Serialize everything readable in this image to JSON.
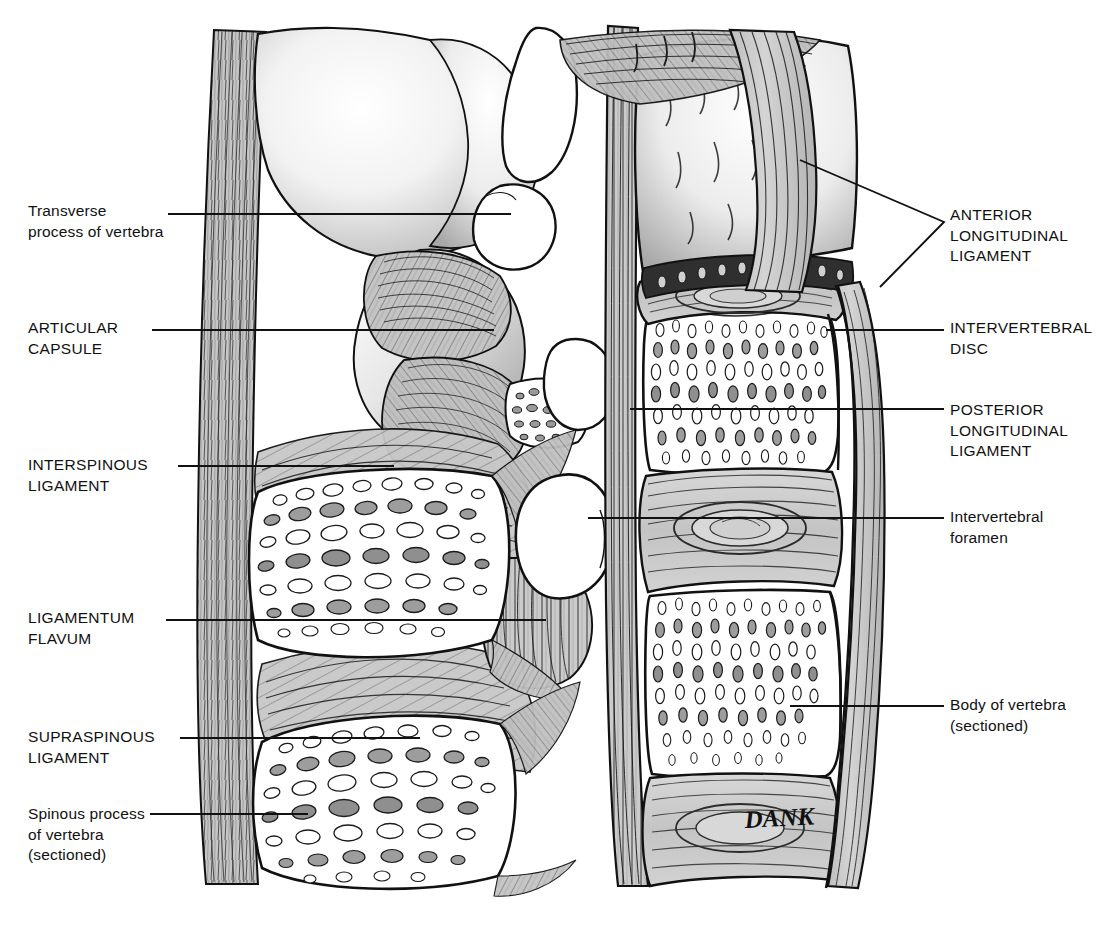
{
  "figure": {
    "signature": "DANK",
    "palette": {
      "ink": "#111111",
      "bone_fill": "#ffffff",
      "bone_shadow": "#d9d9d9",
      "ligament_fill": "#c9c9c9",
      "disc_fill": "#cfcfcf",
      "trabecula_dark": "#8f8f8f",
      "background": "#ffffff"
    }
  },
  "labels_left": [
    {
      "id": "transverse-process",
      "text": "Transverse\nprocess of vertebra",
      "style": "sentence",
      "x": 28,
      "y": 201,
      "leader": {
        "x1": 168,
        "y1": 214,
        "x2": 511,
        "y2": 214
      }
    },
    {
      "id": "articular-capsule",
      "text": "ARTICULAR\nCAPSULE",
      "style": "caps",
      "x": 28,
      "y": 318,
      "leader": {
        "x1": 152,
        "y1": 330,
        "x2": 494,
        "y2": 330
      }
    },
    {
      "id": "interspinous-ligament",
      "text": "INTERSPINOUS\nLIGAMENT",
      "style": "caps",
      "x": 28,
      "y": 455,
      "leader": {
        "x1": 178,
        "y1": 466,
        "x2": 394,
        "y2": 466
      }
    },
    {
      "id": "ligamentum-flavum",
      "text": "LIGAMENTUM\nFLAVUM",
      "style": "caps",
      "x": 28,
      "y": 608,
      "leader": {
        "x1": 166,
        "y1": 620,
        "x2": 546,
        "y2": 620
      }
    },
    {
      "id": "supraspinous-ligament",
      "text": "SUPRASPINOUS\nLIGAMENT",
      "style": "caps",
      "x": 28,
      "y": 727,
      "leader": {
        "x1": 180,
        "y1": 738,
        "x2": 420,
        "y2": 738
      }
    },
    {
      "id": "spinous-process",
      "text": "Spinous process\nof vertebra\n(sectioned)",
      "style": "sentence",
      "x": 28,
      "y": 804,
      "leader": {
        "x1": 150,
        "y1": 814,
        "x2": 308,
        "y2": 814
      }
    }
  ],
  "labels_right": [
    {
      "id": "anterior-longitudinal-ligament",
      "text": "ANTERIOR\nLONGITUDINAL\nLIGAMENT",
      "style": "caps",
      "x": 950,
      "y": 205,
      "leader_fork": {
        "apex_x": 944,
        "apex_y": 222,
        "upper_x": 800,
        "upper_y": 160,
        "lower_x": 880,
        "lower_y": 287
      }
    },
    {
      "id": "intervertebral-disc",
      "text": "INTERVERTEBRAL\nDISC",
      "style": "caps",
      "x": 950,
      "y": 318,
      "leader": {
        "x1": 826,
        "y1": 330,
        "x2": 944,
        "y2": 330
      }
    },
    {
      "id": "posterior-longitudinal-ligament",
      "text": "POSTERIOR\nLONGITUDINAL\nLIGAMENT",
      "style": "caps",
      "x": 950,
      "y": 400,
      "leader": {
        "x1": 630,
        "y1": 409,
        "x2": 944,
        "y2": 409
      }
    },
    {
      "id": "intervertebral-foramen",
      "text": "Intervertebral\nforamen",
      "style": "sentence",
      "x": 950,
      "y": 507,
      "leader": {
        "x1": 588,
        "y1": 518,
        "x2": 944,
        "y2": 518
      }
    },
    {
      "id": "body-of-vertebra",
      "text": "Body of vertebra\n(sectioned)",
      "style": "sentence",
      "x": 950,
      "y": 695,
      "leader": {
        "x1": 790,
        "y1": 706,
        "x2": 944,
        "y2": 706
      }
    }
  ],
  "anatomy": {
    "structures": [
      "transverse process of vertebra",
      "articular capsule",
      "interspinous ligament",
      "ligamentum flavum",
      "supraspinous ligament",
      "spinous process of vertebra (sectioned)",
      "anterior longitudinal ligament",
      "intervertebral disc",
      "posterior longitudinal ligament",
      "intervertebral foramen",
      "body of vertebra (sectioned)"
    ],
    "vertebral_bodies": 2,
    "intervertebral_discs": 2,
    "spinous_processes_sectioned": 2,
    "view": "median sagittal section, lumbar region, anterior to the right"
  }
}
